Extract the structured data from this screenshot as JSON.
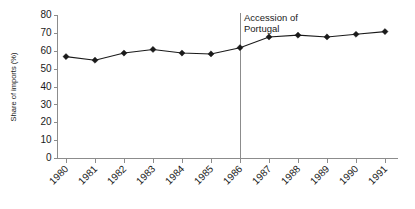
{
  "chart_data": {
    "type": "line",
    "title": "",
    "subtitle": "",
    "xlabel": "",
    "ylabel": "Share of imports (%)",
    "x": [
      1980,
      1981,
      1982,
      1983,
      1984,
      1985,
      1986,
      1987,
      1988,
      1989,
      1990,
      1991
    ],
    "categories": [
      "1980",
      "1981",
      "1982",
      "1983",
      "1984",
      "1985",
      "1986",
      "1987",
      "1988",
      "1989",
      "1990",
      "1991"
    ],
    "values": [
      57,
      55,
      59,
      61,
      59,
      58.5,
      62,
      68,
      69,
      68,
      69.5,
      71
    ],
    "series": [
      {
        "name": "Share of imports (%)",
        "values": [
          57,
          55,
          59,
          61,
          59,
          58.5,
          62,
          68,
          69,
          68,
          69.5,
          71
        ],
        "marker": "diamond",
        "color": "#1a1a1a"
      }
    ],
    "ylim": [
      0,
      80
    ],
    "yticks": [
      0,
      10,
      20,
      30,
      40,
      50,
      60,
      70,
      80
    ],
    "ytick_labels": [
      "0",
      "10",
      "20",
      "30",
      "40",
      "50",
      "60",
      "70",
      "80"
    ],
    "xtick_labels": [
      "1980",
      "1981",
      "1982",
      "1983",
      "1984",
      "1985",
      "1986",
      "1987",
      "1988",
      "1989",
      "1990",
      "1991"
    ],
    "xtick_rotation": 45,
    "grid": false,
    "legend": false,
    "legend_position": "none",
    "annotations": [
      {
        "text_line1": "Accession of",
        "text_line2": "Portugal",
        "at_x": 1986,
        "type": "vertical-line-with-label"
      }
    ],
    "colors": {
      "line": "#1a1a1a",
      "marker": "#1a1a1a",
      "axis": "#8c8c8c",
      "text": "#1a1a1a",
      "background": "#ffffff"
    }
  }
}
